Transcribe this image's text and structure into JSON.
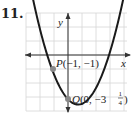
{
  "problem_number": "11.",
  "chart_data": {
    "type": "line",
    "title": "",
    "xlabel": "x",
    "ylabel": "y",
    "function": "y = x^2 - 1.25x - 3.25",
    "grid": true,
    "xlim": [
      -4.2,
      3.6
    ],
    "ylim": [
      -4,
      3.1
    ],
    "points": [
      {
        "name": "P",
        "label": "P(−1, −1)",
        "x": -1,
        "y": -1
      },
      {
        "name": "Q",
        "label": "Q(0, −3¼)",
        "x": 0,
        "y": -3.25
      }
    ],
    "series": [
      {
        "name": "parabola",
        "x": [
          -2,
          -1.5,
          -1,
          -0.5,
          0,
          0.5,
          0.625,
          1,
          1.5,
          2,
          2.5,
          3,
          3.3
        ],
        "y": [
          2.25,
          -0.625,
          -1,
          -2.375,
          -3.25,
          -3.625,
          -3.64,
          -3.5,
          -3.0,
          -2.25,
          -1.25,
          0.0,
          0.51
        ]
      }
    ]
  },
  "labels": {
    "x_axis": "x",
    "y_axis": "y",
    "P_name": "P",
    "P_coords": "(−1, −1)",
    "Q_name": "Q",
    "Q_coords_a": "(0, −3",
    "Q_frac_num": "1",
    "Q_frac_den": "4",
    "Q_close": ")"
  },
  "colors": {
    "curve": "#1a1a1a",
    "grid": "#d6d6d6",
    "point": "#8a8a8a",
    "axis": "#333333"
  }
}
